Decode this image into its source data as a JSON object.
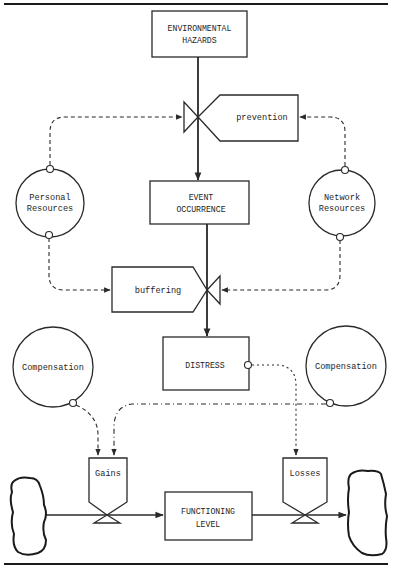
{
  "diagram": {
    "type": "stock-and-flow stress model",
    "nodes": {
      "environmental_hazards": {
        "line1": "ENVIRONMENTAL",
        "line2": "HAZARDS"
      },
      "prevention": {
        "label": "prevention"
      },
      "personal_resources": {
        "line1": "Personal",
        "line2": "Resources"
      },
      "network_resources": {
        "line1": "Network",
        "line2": "Resources"
      },
      "event_occurrence": {
        "line1": "EVENT",
        "line2": "OCCURRENCE"
      },
      "buffering": {
        "label": "buffering"
      },
      "distress": {
        "label": "DISTRESS"
      },
      "compensation_left": {
        "label": "Compensation"
      },
      "compensation_right": {
        "label": "Compensation"
      },
      "gains": {
        "label": "Gains"
      },
      "losses": {
        "label": "Losses"
      },
      "functioning_level": {
        "line1": "FUNCTIONING",
        "line2": "LEVEL"
      }
    },
    "edges": [
      {
        "from": "ENVIRONMENTAL HAZARDS",
        "to": "EVENT OCCURRENCE",
        "style": "solid",
        "via": "prevention valve"
      },
      {
        "from": "Personal Resources",
        "to": "prevention",
        "style": "dashed"
      },
      {
        "from": "Network Resources",
        "to": "prevention",
        "style": "dashed"
      },
      {
        "from": "EVENT OCCURRENCE",
        "to": "DISTRESS",
        "style": "solid",
        "via": "buffering valve"
      },
      {
        "from": "Personal Resources",
        "to": "buffering",
        "style": "dashed"
      },
      {
        "from": "Network Resources",
        "to": "buffering",
        "style": "dashed"
      },
      {
        "from": "Compensation (left)",
        "to": "Gains",
        "style": "dashed"
      },
      {
        "from": "Compensation (right)",
        "to": "Gains",
        "style": "dash-dot"
      },
      {
        "from": "DISTRESS",
        "to": "Losses",
        "style": "dotted"
      },
      {
        "from": "source cloud",
        "to": "FUNCTIONING LEVEL",
        "style": "solid",
        "via": "Gains valve"
      },
      {
        "from": "FUNCTIONING LEVEL",
        "to": "sink cloud",
        "style": "solid",
        "via": "Losses valve"
      }
    ]
  }
}
